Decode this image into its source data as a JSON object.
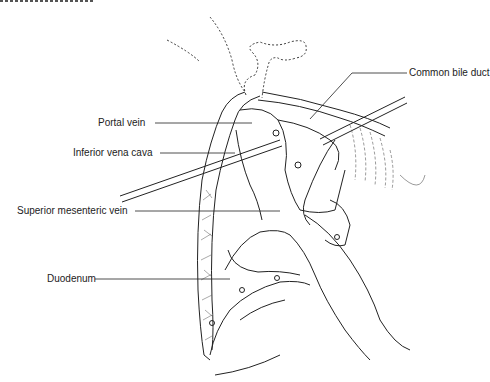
{
  "figure": {
    "type": "surgical-illustration",
    "labels": {
      "common_bile_duct": "Common bile duct",
      "portal_vein": "Portal vein",
      "inferior_vena_cava": "Inferior vena cava",
      "superior_mesenteric_vein": "Superior mesenteric vein",
      "duodenum": "Duodenum"
    },
    "colors": {
      "ink": "#222222",
      "background": "#ffffff"
    }
  }
}
